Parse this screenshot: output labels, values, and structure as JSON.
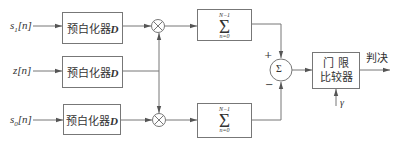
{
  "inputs": [
    {
      "name": "s",
      "sub": "1",
      "arg": "[n]"
    },
    {
      "name": "z",
      "sub": "",
      "arg": "[n]"
    },
    {
      "name": "s",
      "sub": "0",
      "arg": "[n]"
    }
  ],
  "prewhitener": {
    "label": "预白化器",
    "symbol": "D"
  },
  "summation": {
    "upper": "N−1",
    "symbol": "Σ",
    "lower": "n=0"
  },
  "adder": {
    "symbol": "Σ",
    "plus": "+",
    "minus": "−"
  },
  "comparator": {
    "line1": "门 限",
    "line2": "比较器"
  },
  "threshold": {
    "symbol": "γ"
  },
  "output": {
    "label": "判决"
  },
  "colors": {
    "line": "#777777",
    "text": "#333333",
    "background": "#ffffff"
  }
}
